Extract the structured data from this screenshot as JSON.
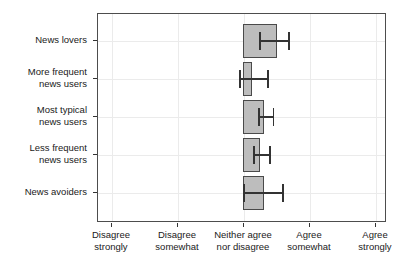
{
  "chart_data": {
    "type": "bar",
    "title": "",
    "subtitle": "",
    "xlabel": "",
    "ylabel": "",
    "grid": true,
    "legend": false,
    "orientation": "horizontal",
    "xlim": [
      0.5,
      5.5
    ],
    "x_ticks": [
      1,
      2,
      3,
      4,
      5
    ],
    "x_tick_labels": [
      "Disagree\nstrongly",
      "Disagree\nsomewhat",
      "Neither agree\nnor disagree",
      "Agree\nsomewhat",
      "Agree\nstrongly"
    ],
    "categories": [
      "News lovers",
      "More frequent\nnews users",
      "Most typical\nnews users",
      "Less frequent\nnews users",
      "News avoiders"
    ],
    "bar_base": 2.98,
    "series": [
      {
        "name": "Mean agreement",
        "values": [
          3.5,
          3.12,
          3.3,
          3.24,
          3.3
        ],
        "ci_low": [
          3.24,
          2.94,
          3.23,
          3.15,
          3.0
        ],
        "ci_high": [
          3.68,
          3.36,
          3.45,
          3.39,
          3.59
        ]
      }
    ],
    "colors": {
      "bar_fill": "#bdbdbd",
      "bar_stroke": "#4a4a4a",
      "error_bar": "#333333",
      "panel_border": "#4d4d4d",
      "gridline": "#ebebeb",
      "background": "#ffffff",
      "text": "#1a1a1a"
    }
  }
}
